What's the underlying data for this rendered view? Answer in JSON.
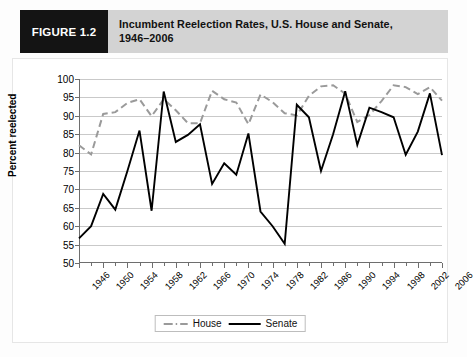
{
  "figure": {
    "badge_label": "FIGURE 1.2",
    "title_line1": "Incumbent Reelection Rates, U.S. House and Senate,",
    "title_line2": "1946–2006"
  },
  "colors": {
    "badge_bg": "#141414",
    "title_bg": "#d3d3d3",
    "house_line": "#9a9a9a",
    "senate_line": "#000000",
    "gridline": "#c9c9c9",
    "axis": "#6e6e6e",
    "plot_bg": "#ffffff"
  },
  "chart_data": {
    "type": "line",
    "title": "Incumbent Reelection Rates, U.S. House and Senate, 1946–2006",
    "xlabel": "",
    "ylabel": "Percent reelected",
    "ylim": [
      50,
      100
    ],
    "ytick_step": 5,
    "yticks": [
      50,
      55,
      60,
      65,
      70,
      75,
      80,
      85,
      90,
      95,
      100
    ],
    "xlim": [
      1946,
      2006
    ],
    "x": [
      1946,
      1948,
      1950,
      1952,
      1954,
      1956,
      1958,
      1960,
      1962,
      1964,
      1966,
      1968,
      1970,
      1972,
      1974,
      1976,
      1978,
      1980,
      1982,
      1984,
      1986,
      1988,
      1990,
      1992,
      1994,
      1996,
      1998,
      2000,
      2002,
      2004,
      2006
    ],
    "xticks_major": [
      1946,
      1950,
      1954,
      1958,
      1962,
      1966,
      1970,
      1974,
      1978,
      1982,
      1986,
      1990,
      1994,
      1998,
      2002,
      2006
    ],
    "xtick_labels": [
      "1946",
      "1950",
      "1954",
      "1958",
      "1962",
      "1966",
      "1970",
      "1974",
      "1978",
      "1982",
      "1986",
      "1990",
      "1994",
      "1998",
      "2002",
      "2006"
    ],
    "grid": true,
    "legend_position": "bottom-center",
    "series": [
      {
        "name": "House",
        "style": "dashed",
        "color": "#9a9a9a",
        "values": [
          82,
          79.5,
          90.5,
          91,
          93.5,
          94.5,
          89.9,
          94.5,
          91.5,
          88,
          88,
          96.8,
          94.5,
          93.6,
          87.7,
          95.8,
          93.7,
          90.7,
          90.1,
          95.4,
          98.0,
          98.3,
          96.0,
          88.3,
          90.2,
          94.0,
          98.3,
          97.8,
          95.9,
          97.8,
          94.1
        ]
      },
      {
        "name": "Senate",
        "style": "solid",
        "color": "#000000",
        "values": [
          56.7,
          60,
          68.8,
          64.5,
          75,
          86,
          64.2,
          96.6,
          82.9,
          84.8,
          87.7,
          71.5,
          77.1,
          74,
          85.2,
          64,
          60,
          55.2,
          93,
          89.6,
          75,
          85,
          96.7,
          82.1,
          92.2,
          91,
          89.6,
          79.4,
          85.7,
          96.1,
          79.3
        ]
      }
    ]
  },
  "legend": {
    "items": [
      {
        "label": "House",
        "style": "dashed",
        "color": "#9a9a9a"
      },
      {
        "label": "Senate",
        "style": "solid",
        "color": "#000000"
      }
    ]
  },
  "y_axis_title": "Percent reelected"
}
